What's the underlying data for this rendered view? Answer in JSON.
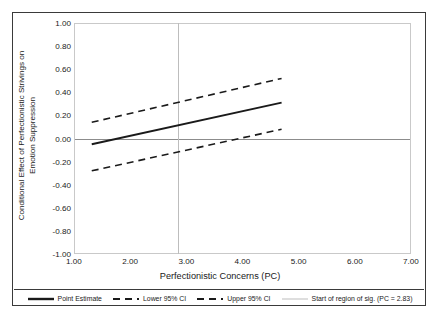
{
  "chart_data": {
    "type": "line",
    "title": "",
    "xlabel": "Perfectionistic Concerns (PC)",
    "ylabel": "Conditional Effect of Perfectionistic Strivings on Emotion Suppression",
    "ylabel_line1": "Conditional Effect of Perfectionistic Strivings on",
    "ylabel_line2": "Emotion Suppression",
    "xlim": [
      1.0,
      7.0
    ],
    "ylim": [
      -1.0,
      1.0
    ],
    "xticks": [
      "1.00",
      "2.00",
      "3.00",
      "4.00",
      "5.00",
      "6.00",
      "7.00"
    ],
    "xtick_values": [
      1.0,
      2.0,
      3.0,
      4.0,
      5.0,
      6.0,
      7.0
    ],
    "yticks": [
      "1.00",
      "0.80",
      "0.60",
      "0.40",
      "0.20",
      "0.00",
      "-0.20",
      "-0.40",
      "-0.60",
      "-0.80",
      "-1.00"
    ],
    "ytick_values": [
      1.0,
      0.8,
      0.6,
      0.4,
      0.2,
      0.0,
      -0.2,
      -0.4,
      -0.6,
      -0.8,
      -1.0
    ],
    "grid": false,
    "legend_position": "bottom",
    "x": [
      1.3,
      4.7
    ],
    "series": [
      {
        "name": "Point Estimate",
        "style": "solid",
        "color": "#1a1a1a",
        "values": [
          -0.05,
          0.31
        ]
      },
      {
        "name": "Lower 95% CI",
        "style": "dashed",
        "color": "#1a1a1a",
        "values": [
          -0.28,
          0.08
        ]
      },
      {
        "name": "Upper 95% CI",
        "style": "dashed",
        "color": "#1a1a1a",
        "values": [
          0.14,
          0.52
        ]
      }
    ],
    "reference_lines": [
      {
        "name": "Start of region of sig. (PC = 2.83)",
        "orientation": "vertical",
        "value": 2.83,
        "color": "#bdbdbd"
      },
      {
        "name": "zero-line",
        "orientation": "horizontal",
        "value": 0.0,
        "color": "#8c8c8c"
      }
    ],
    "legend": [
      {
        "label": "Point Estimate",
        "style": "solid",
        "color": "#1a1a1a"
      },
      {
        "label": "Lower 95% CI",
        "style": "dashed",
        "color": "#1a1a1a"
      },
      {
        "label": "Upper 95% CI",
        "style": "dashed",
        "color": "#1a1a1a"
      },
      {
        "label": "Start of region of sig. (PC = 2.83)",
        "style": "thin-solid",
        "color": "#bdbdbd"
      }
    ]
  }
}
